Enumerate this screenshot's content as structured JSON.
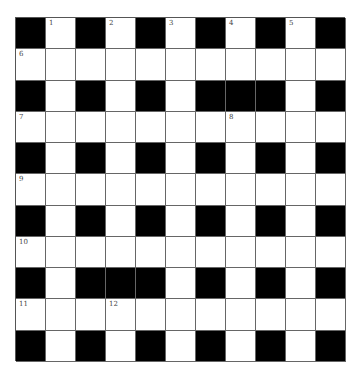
{
  "puzzle": {
    "rows": 11,
    "cols": 11,
    "colors": {
      "black": "#000000",
      "white": "#ffffff",
      "line": "#666666"
    },
    "grid": [
      "#.#.#.#.#.#",
      "...........",
      "#.#.#.###.#",
      "...........",
      "#.#.#.#.#.#",
      "...........",
      "#.#.#.#.#.#",
      "...........",
      "#.###.#.#.#",
      "...........",
      "#.#.#.#.#.#"
    ],
    "numbers": [
      {
        "row": 0,
        "col": 1,
        "n": "1"
      },
      {
        "row": 0,
        "col": 3,
        "n": "2"
      },
      {
        "row": 0,
        "col": 5,
        "n": "3"
      },
      {
        "row": 0,
        "col": 7,
        "n": "4"
      },
      {
        "row": 0,
        "col": 9,
        "n": "5"
      },
      {
        "row": 1,
        "col": 0,
        "n": "6"
      },
      {
        "row": 3,
        "col": 0,
        "n": "7"
      },
      {
        "row": 3,
        "col": 7,
        "n": "8"
      },
      {
        "row": 5,
        "col": 0,
        "n": "9"
      },
      {
        "row": 7,
        "col": 0,
        "n": "10"
      },
      {
        "row": 9,
        "col": 0,
        "n": "11"
      },
      {
        "row": 9,
        "col": 3,
        "n": "12"
      }
    ]
  }
}
